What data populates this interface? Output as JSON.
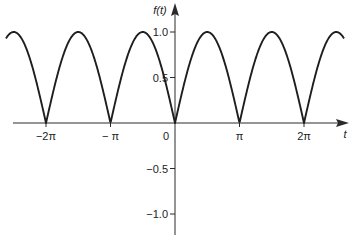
{
  "chart_data": {
    "type": "line",
    "title": "",
    "function": "f(t) = |sin t|",
    "xlabel": "t",
    "ylabel": "f(t)",
    "x_unit": "pi",
    "x_range_pi": [
      -2.62,
      2.62
    ],
    "ylim": [
      -1.2,
      1.2
    ],
    "grid": false,
    "legend": null,
    "x_ticks": [
      {
        "value_pi": -2,
        "label": "−2π"
      },
      {
        "value_pi": -1,
        "label": "− π"
      },
      {
        "value_pi": 0,
        "label": "0"
      },
      {
        "value_pi": 1,
        "label": "π"
      },
      {
        "value_pi": 2,
        "label": "2π"
      }
    ],
    "y_ticks": [
      {
        "value": 1.0,
        "label": "1.0"
      },
      {
        "value": 0.5,
        "label": "0.5"
      },
      {
        "value": -0.5,
        "label": "−0.5"
      },
      {
        "value": -1.0,
        "label": "−1.0"
      }
    ],
    "series": [
      {
        "name": "f(t)",
        "x_pi": [
          -2.5,
          -2.25,
          -2,
          -1.75,
          -1.5,
          -1.25,
          -1,
          -0.75,
          -0.5,
          -0.25,
          0,
          0.25,
          0.5,
          0.75,
          1,
          1.25,
          1.5,
          1.75,
          2,
          2.25,
          2.5
        ],
        "values": [
          1.0,
          0.707,
          0.0,
          0.707,
          1.0,
          0.707,
          0.0,
          0.707,
          1.0,
          0.707,
          0.0,
          0.707,
          1.0,
          0.707,
          0.0,
          0.707,
          1.0,
          0.707,
          0.0,
          0.707,
          1.0
        ]
      }
    ],
    "colors": {
      "curve": "#1e1e1e",
      "axis": "#2a2a2a"
    }
  }
}
